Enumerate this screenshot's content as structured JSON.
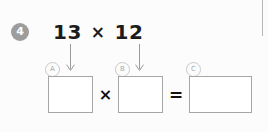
{
  "problem": {
    "number": "4",
    "expression": {
      "left_operand": "13",
      "operator": "×",
      "right_operand": "12"
    }
  },
  "answer_row": {
    "slots": [
      {
        "tag": "A",
        "value": "",
        "placeholder": ""
      },
      {
        "tag": "B",
        "value": "",
        "placeholder": ""
      },
      {
        "tag": "C",
        "value": "",
        "placeholder": ""
      }
    ],
    "operators": {
      "multiply": "×",
      "equals": "="
    }
  },
  "icons": {
    "arrow_a": "arrow-down-icon",
    "arrow_b": "arrow-down-icon"
  },
  "colors": {
    "badge_background": "#9d9d9d",
    "badge_text": "#ffffff",
    "expression_text": "#1c1c1c",
    "box_border": "#a6a6a6",
    "tag_border": "#c9c9c9",
    "tag_text": "#a9a9a9",
    "arrow": "#9a9a9a",
    "divider": "#b8b8b8",
    "page_background": "#fcfcfc"
  }
}
